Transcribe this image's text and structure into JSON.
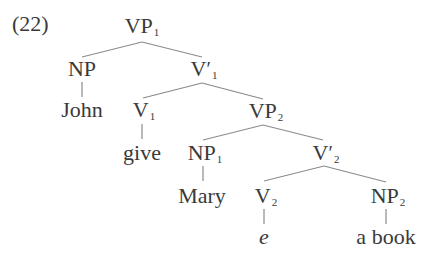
{
  "example_number": "(22)",
  "tree": {
    "nodes": {
      "vp1": {
        "cat": "VP",
        "sub": "1",
        "prime": ""
      },
      "np": {
        "cat": "NP",
        "sub": "",
        "prime": ""
      },
      "vbar1": {
        "cat": "V",
        "sub": "1",
        "prime": "′"
      },
      "john": {
        "word": "John"
      },
      "v1": {
        "cat": "V",
        "sub": "1",
        "prime": ""
      },
      "vp2": {
        "cat": "VP",
        "sub": "2",
        "prime": ""
      },
      "give": {
        "word": "give"
      },
      "np1": {
        "cat": "NP",
        "sub": "1",
        "prime": ""
      },
      "vbar2": {
        "cat": "V",
        "sub": "2",
        "prime": "′"
      },
      "mary": {
        "word": "Mary"
      },
      "v2": {
        "cat": "V",
        "sub": "2",
        "prime": ""
      },
      "np2": {
        "cat": "NP",
        "sub": "2",
        "prime": ""
      },
      "e": {
        "word": "e"
      },
      "a_book": {
        "word": "a book"
      }
    },
    "edges": [
      [
        "vp1",
        "np"
      ],
      [
        "vp1",
        "vbar1"
      ],
      [
        "np",
        "john"
      ],
      [
        "vbar1",
        "v1"
      ],
      [
        "vbar1",
        "vp2"
      ],
      [
        "v1",
        "give"
      ],
      [
        "vp2",
        "np1"
      ],
      [
        "vp2",
        "vbar2"
      ],
      [
        "np1",
        "mary"
      ],
      [
        "vbar2",
        "v2"
      ],
      [
        "vbar2",
        "np2"
      ],
      [
        "v2",
        "e"
      ],
      [
        "np2",
        "a_book"
      ]
    ]
  }
}
